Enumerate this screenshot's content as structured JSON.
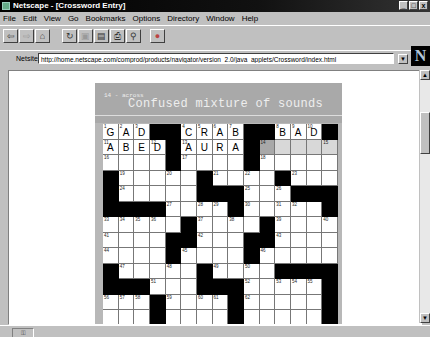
{
  "window": {
    "title": "Netscape - [Crossword Entry]",
    "controls": [
      "_",
      "□",
      "x"
    ]
  },
  "menu": [
    "File",
    "Edit",
    "View",
    "Go",
    "Bookmarks",
    "Options",
    "Directory",
    "Window",
    "Help"
  ],
  "toolbar": [
    {
      "name": "back",
      "icon": "⇦"
    },
    {
      "name": "forward",
      "icon": "⇨"
    },
    {
      "name": "home",
      "icon": "⌂"
    },
    {
      "name": "reload",
      "icon": "↻"
    },
    {
      "name": "images",
      "icon": "▣"
    },
    {
      "name": "open",
      "icon": "▤"
    },
    {
      "name": "print",
      "icon": "⎙"
    },
    {
      "name": "find",
      "icon": "⚲"
    },
    {
      "name": "stop",
      "icon": "●"
    }
  ],
  "location": {
    "label": "Netsite:",
    "url": "http://home.netscape.com/comprod/products/navigator/version_2.0/java_applets/Crossword/index.html",
    "logo": "N"
  },
  "clue": {
    "number": "14 - across",
    "text": "Confused mixture of sounds"
  },
  "status": {
    "icon": "security-key"
  },
  "grid": {
    "columns": 15,
    "highlight_color": "#d8d8d8",
    "current_color": "#a8a8a8",
    "rows": [
      [
        {
          "n": "1",
          "l": "G"
        },
        {
          "n": "2",
          "l": "A"
        },
        {
          "n": "3",
          "l": "D"
        },
        "#",
        "#",
        {
          "n": "4",
          "l": "C"
        },
        {
          "n": "5",
          "l": "R"
        },
        {
          "n": "6",
          "l": "A"
        },
        {
          "n": "7",
          "l": "B"
        },
        "#",
        "#",
        {
          "n": "8",
          "l": "B"
        },
        {
          "n": "9",
          "l": "A"
        },
        {
          "n": "10",
          "l": "D"
        },
        "#"
      ],
      [
        {
          "n": "11",
          "l": "A"
        },
        {
          "l": "B"
        },
        {
          "l": "E"
        },
        {
          "n": "12",
          "l": "D"
        },
        "#",
        {
          "n": "13",
          "l": "A"
        },
        {
          "l": "U"
        },
        {
          "l": "R"
        },
        {
          "l": "A"
        },
        "#",
        {
          "n": "14",
          "s": "cur"
        },
        {
          "s": "hl"
        },
        {
          "s": "hl"
        },
        {
          "s": "hl"
        },
        {
          "n": "15",
          "s": "hl"
        }
      ],
      [
        {
          "n": "16"
        },
        {},
        {},
        {},
        "#",
        {
          "n": "17"
        },
        {},
        {},
        {},
        "#",
        {
          "n": "18"
        },
        {},
        {},
        {},
        {}
      ],
      [
        "#",
        {
          "n": "19"
        },
        {},
        {},
        {
          "n": "20"
        },
        {},
        "#",
        {
          "n": "21"
        },
        {},
        {
          "n": "22"
        },
        {},
        "#",
        {
          "n": "23"
        },
        {},
        {}
      ],
      [
        "#",
        {
          "n": "24"
        },
        {},
        {},
        {},
        {},
        "#",
        "#",
        "#",
        {
          "n": "25"
        },
        {},
        {
          "n": "26"
        },
        "#",
        "#",
        "#"
      ],
      [
        "#",
        "#",
        "#",
        "#",
        {
          "n": "27"
        },
        {},
        {
          "n": "28"
        },
        {
          "n": "29"
        },
        "#",
        {
          "n": "30"
        },
        {},
        {
          "n": "31"
        },
        {
          "n": "32"
        },
        {},
        "#"
      ],
      [
        {
          "n": "33"
        },
        {
          "n": "34"
        },
        {
          "n": "35"
        },
        {
          "n": "36"
        },
        {},
        "#",
        {
          "n": "37"
        },
        {},
        {
          "n": "38"
        },
        {},
        "#",
        {
          "n": "39"
        },
        {},
        {},
        {
          "n": "40"
        }
      ],
      [
        {
          "n": "41"
        },
        {},
        {},
        {},
        "#",
        "#",
        {
          "n": "42"
        },
        {},
        {},
        "#",
        "#",
        {
          "n": "43"
        },
        {},
        {},
        {}
      ],
      [
        {
          "n": "44"
        },
        {},
        {},
        {},
        "#",
        {
          "n": "45"
        },
        {},
        {},
        {},
        "#",
        {
          "n": "46"
        },
        {},
        {},
        {},
        {}
      ],
      [
        "#",
        {
          "n": "47"
        },
        {},
        {},
        {
          "n": "48"
        },
        {},
        "#",
        {
          "n": "49"
        },
        {},
        {
          "n": "50"
        },
        {},
        "#",
        "#",
        "#",
        "#"
      ],
      [
        "#",
        "#",
        "#",
        {
          "n": "51"
        },
        {},
        {},
        "#",
        "#",
        "#",
        {
          "n": "52"
        },
        {},
        {
          "n": "53"
        },
        {
          "n": "54"
        },
        {
          "n": "55"
        },
        "#"
      ],
      [
        {
          "n": "56"
        },
        {
          "n": "57"
        },
        {
          "n": "58"
        },
        "#",
        {
          "n": "59"
        },
        {},
        {
          "n": "60"
        },
        {
          "n": "61"
        },
        "#",
        {
          "n": "62"
        },
        {},
        {},
        {},
        {},
        "#"
      ],
      [
        {},
        {},
        {},
        "#",
        {},
        {},
        {},
        {},
        "#",
        {},
        {},
        {},
        {},
        {},
        "#"
      ]
    ]
  }
}
